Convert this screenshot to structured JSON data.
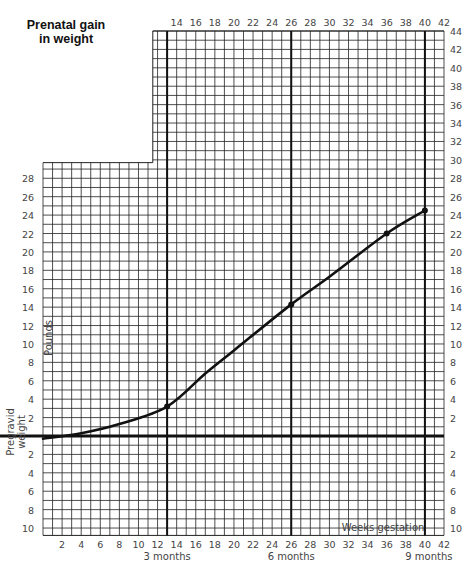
{
  "title_line1": "Prenatal gain",
  "title_line2": "in weight",
  "chart_data": {
    "type": "line",
    "title": "Prenatal gain in weight",
    "xlabel": "Weeks gestation",
    "ylabel": "Pounds",
    "baseline_label": "Pregravid weight",
    "x_ticks": [
      2,
      4,
      6,
      8,
      10,
      12,
      14,
      16,
      18,
      20,
      22,
      24,
      26,
      28,
      30,
      32,
      34,
      36,
      38,
      40,
      42
    ],
    "top_x_ticks": [
      14,
      16,
      18,
      20,
      22,
      24,
      26,
      28,
      30,
      32,
      34,
      36,
      38,
      40,
      42
    ],
    "y_ticks_right_positive": [
      2,
      4,
      6,
      8,
      10,
      12,
      14,
      16,
      18,
      20,
      22,
      24,
      26,
      28,
      30,
      32,
      34,
      36,
      38,
      40,
      42,
      44
    ],
    "y_ticks_left_positive": [
      2,
      4,
      6,
      8,
      10,
      12,
      14,
      16,
      18,
      20,
      22,
      24,
      26,
      28
    ],
    "y_ticks_negative": [
      2,
      4,
      6,
      8,
      10
    ],
    "xlim": [
      0,
      42
    ],
    "ylim": [
      -10,
      44
    ],
    "month_markers": [
      {
        "week": 13,
        "label": "3 months"
      },
      {
        "week": 26,
        "label": "6 months"
      },
      {
        "week": 40,
        "label": "9 months"
      }
    ],
    "series": [
      {
        "name": "Weight gain",
        "x": [
          0,
          4,
          8,
          13,
          17,
          20,
          26,
          30,
          36,
          40
        ],
        "y": [
          -0.3,
          0.3,
          1.3,
          3.2,
          6.8,
          9.3,
          14.3,
          17.3,
          22.0,
          24.5
        ],
        "markers": [
          {
            "x": 13,
            "y": 3.2
          },
          {
            "x": 26,
            "y": 14.3
          },
          {
            "x": 36,
            "y": 22.0
          },
          {
            "x": 40,
            "y": 24.5
          }
        ]
      }
    ],
    "grid": true
  }
}
